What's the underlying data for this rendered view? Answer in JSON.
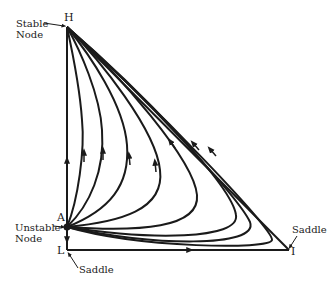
{
  "diagram": {
    "type": "phase-portrait",
    "nodes": [
      {
        "id": "H",
        "label": "H",
        "x": 67,
        "y": 27,
        "annotation": [
          "Stable",
          "Node"
        ]
      },
      {
        "id": "A",
        "label": "A",
        "x": 67,
        "y": 227,
        "annotation": [
          "Unstable",
          "Node"
        ]
      },
      {
        "id": "L",
        "label": "L",
        "x": 67,
        "y": 250,
        "annotation": [
          "Saddle"
        ]
      },
      {
        "id": "I",
        "label": "I",
        "x": 289,
        "y": 250,
        "annotation": [
          "Saddle"
        ]
      }
    ],
    "labels": {
      "H": "H",
      "A": "A",
      "L": "L",
      "I": "I",
      "stable_line1": "Stable",
      "stable_line2": "Node",
      "unstable_line1": "Unstable",
      "unstable_line2": "Node",
      "saddle_L": "Saddle",
      "saddle_I": "Saddle"
    },
    "edges": [
      {
        "from": "A",
        "to": "H",
        "kind": "boundary-vertical"
      },
      {
        "from": "A",
        "to": "L",
        "kind": "boundary-short"
      },
      {
        "from": "L",
        "to": "I",
        "kind": "boundary-horizontal"
      },
      {
        "from": "I",
        "to": "H",
        "kind": "boundary-hypotenuse"
      }
    ],
    "trajectory_count": 8,
    "colors": {
      "line": "#1a1a1a",
      "background": "#ffffff"
    }
  }
}
